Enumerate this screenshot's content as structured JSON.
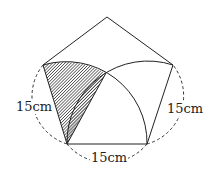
{
  "diagram": {
    "type": "geometry",
    "shape": "regular pentagon",
    "side_length": "15cm",
    "labels": {
      "left_side": "15cm",
      "right_side": "15cm",
      "bottom_side": "15cm"
    },
    "vertices": {
      "top": [
        107,
        17
      ],
      "left": [
        43,
        65
      ],
      "right": [
        173,
        65
      ],
      "bottom_left": [
        67,
        144
      ],
      "bottom_right": [
        147,
        144
      ]
    },
    "arc_intersection": [
      106,
      73
    ],
    "colors": {
      "stroke": "#222222",
      "hatch": "#333333",
      "background": "#ffffff"
    }
  }
}
